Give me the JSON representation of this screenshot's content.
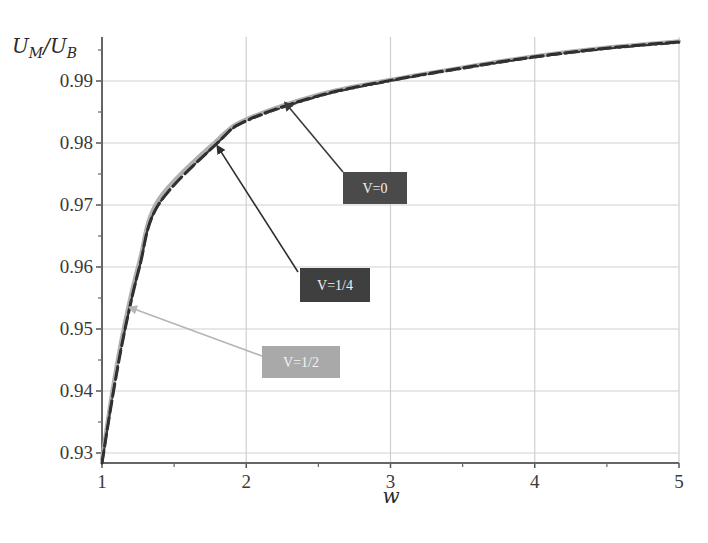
{
  "chart_data": {
    "type": "line",
    "title": "",
    "xlabel": "w",
    "ylabel": "U_M/U_B",
    "ylabel_parts": {
      "num": "U",
      "num_sub": "M",
      "sep": "/",
      "den": "U",
      "den_sub": "B"
    },
    "xlim": [
      1,
      5
    ],
    "ylim": [
      0.928,
      0.997
    ],
    "x_ticks": [
      "1",
      "2",
      "3",
      "4",
      "5"
    ],
    "y_ticks": [
      "0.93",
      "0.94",
      "0.95",
      "0.96",
      "0.97",
      "0.98",
      "0.99"
    ],
    "grid": true,
    "legend": "annotation boxes with arrows",
    "series": [
      {
        "name": "V=0",
        "style": "dash-dot",
        "color": "#333333",
        "x": [
          1.0,
          1.08,
          1.16,
          1.26,
          1.39,
          1.8,
          2.0,
          2.5,
          3.0,
          3.5,
          4.0,
          4.5,
          5.0
        ],
        "y": [
          0.9284,
          0.94,
          0.95,
          0.96,
          0.97,
          0.98,
          0.9835,
          0.9875,
          0.99,
          0.992,
          0.9938,
          0.9952,
          0.9962
        ]
      },
      {
        "name": "V=1/4",
        "style": "dashed",
        "color": "#2b2b2b",
        "x": [
          1.0,
          1.08,
          1.16,
          1.26,
          1.39,
          1.8,
          2.0,
          2.5,
          3.0,
          3.5,
          4.0,
          4.5,
          5.0
        ],
        "y": [
          0.9284,
          0.94,
          0.95,
          0.96,
          0.97,
          0.98,
          0.9836,
          0.9876,
          0.9901,
          0.9921,
          0.9939,
          0.9953,
          0.9963
        ]
      },
      {
        "name": "V=1/2",
        "style": "solid",
        "color": "#b0b0b0",
        "x": [
          1.0,
          1.08,
          1.16,
          1.26,
          1.39,
          1.8,
          2.0,
          2.5,
          3.0,
          3.5,
          4.0,
          4.5,
          5.0
        ],
        "y": [
          0.929,
          0.9412,
          0.9512,
          0.961,
          0.9708,
          0.9805,
          0.9838,
          0.9878,
          0.9902,
          0.9922,
          0.994,
          0.9954,
          0.9964
        ]
      }
    ],
    "annotations": [
      {
        "text": "V=0",
        "box_color": "#4a4a4a",
        "point_x": 2.27,
        "point_y": 0.9865
      },
      {
        "text": "V=1/4",
        "box_color": "#3f3f3f",
        "point_x": 1.8,
        "point_y": 0.9795
      },
      {
        "text": "V=1/2",
        "box_color": "#a9a9a9",
        "point_x": 1.19,
        "point_y": 0.9535
      }
    ]
  }
}
